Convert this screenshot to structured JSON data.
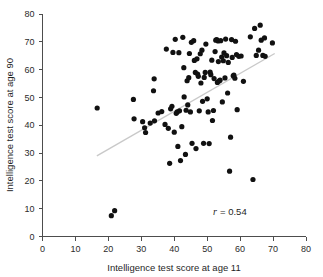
{
  "chart_data": {
    "type": "scatter",
    "title": "",
    "xlabel": "Intelligence test score at age 11",
    "ylabel": "Intelligence test score at age 90",
    "xlim": [
      0,
      80
    ],
    "ylim": [
      0,
      80
    ],
    "xticks": [
      0,
      10,
      20,
      30,
      40,
      50,
      60,
      70,
      80
    ],
    "yticks": [
      0,
      10,
      20,
      30,
      40,
      50,
      60,
      70,
      80
    ],
    "xticklabels": [
      "0",
      "10",
      "20",
      "30",
      "40",
      "50",
      "60",
      "70",
      "80"
    ],
    "yticklabels": [
      "0",
      "10",
      "20",
      "30",
      "40",
      "50",
      "60",
      "70",
      "80"
    ],
    "grid": false,
    "legend": null,
    "annotations": [
      {
        "name": "correlation-annotation",
        "symbol": "r",
        "text": "= 0.54",
        "full_text": "r = 0.54",
        "value": 0.54,
        "x": 52,
        "y": 9
      }
    ],
    "fit_line": {
      "name": "regression-line",
      "color": "#c9c9c9",
      "x_start": 16.5,
      "y_start": 29.0,
      "x_end": 70.5,
      "y_end": 65.8
    },
    "marker": {
      "shape": "circle",
      "color": "#111111",
      "size": 2.6
    },
    "points": [
      [
        16.6,
        46.2
      ],
      [
        20.9,
        7.5
      ],
      [
        21.9,
        9.3
      ],
      [
        27.6,
        49.3
      ],
      [
        27.8,
        42.3
      ],
      [
        30.4,
        41.3
      ],
      [
        31.0,
        39.1
      ],
      [
        31.3,
        37.4
      ],
      [
        32.7,
        40.8
      ],
      [
        33.7,
        52.4
      ],
      [
        33.9,
        56.7
      ],
      [
        34.0,
        41.6
      ],
      [
        35.1,
        44.4
      ],
      [
        36.2,
        44.9
      ],
      [
        37.2,
        40.3
      ],
      [
        37.6,
        67.4
      ],
      [
        38.2,
        38.9
      ],
      [
        38.6,
        26.3
      ],
      [
        38.9,
        45.9
      ],
      [
        39.3,
        46.8
      ],
      [
        39.6,
        66.2
      ],
      [
        40.0,
        37.5
      ],
      [
        40.3,
        70.9
      ],
      [
        40.6,
        44.3
      ],
      [
        40.9,
        44.8
      ],
      [
        41.1,
        32.4
      ],
      [
        41.4,
        66.1
      ],
      [
        41.6,
        45.2
      ],
      [
        41.9,
        27.3
      ],
      [
        42.3,
        39.5
      ],
      [
        42.6,
        71.6
      ],
      [
        42.9,
        60.7
      ],
      [
        43.0,
        50.2
      ],
      [
        43.4,
        29.5
      ],
      [
        43.6,
        45.4
      ],
      [
        43.9,
        56.0
      ],
      [
        44.1,
        47.3
      ],
      [
        44.4,
        57.1
      ],
      [
        44.6,
        65.8
      ],
      [
        44.9,
        44.8
      ],
      [
        45.2,
        69.8
      ],
      [
        45.4,
        33.5
      ],
      [
        45.9,
        70.4
      ],
      [
        46.1,
        63.3
      ],
      [
        46.4,
        59.0
      ],
      [
        46.6,
        31.6
      ],
      [
        46.9,
        63.9
      ],
      [
        47.1,
        58.4
      ],
      [
        47.3,
        57.6
      ],
      [
        47.6,
        45.2
      ],
      [
        47.9,
        65.7
      ],
      [
        48.1,
        55.2
      ],
      [
        48.4,
        67.0
      ],
      [
        48.6,
        48.6
      ],
      [
        48.9,
        33.5
      ],
      [
        49.1,
        57.2
      ],
      [
        49.4,
        59.0
      ],
      [
        49.6,
        69.2
      ],
      [
        50.0,
        49.5
      ],
      [
        50.3,
        44.8
      ],
      [
        50.6,
        33.4
      ],
      [
        50.9,
        59.1
      ],
      [
        51.1,
        58.2
      ],
      [
        51.4,
        63.4
      ],
      [
        51.6,
        41.7
      ],
      [
        51.9,
        45.3
      ],
      [
        52.1,
        56.8
      ],
      [
        52.4,
        66.5
      ],
      [
        52.6,
        70.6
      ],
      [
        52.9,
        70.8
      ],
      [
        53.1,
        55.4
      ],
      [
        53.3,
        70.3
      ],
      [
        53.4,
        62.9
      ],
      [
        53.6,
        55.9
      ],
      [
        53.9,
        56.2
      ],
      [
        54.1,
        70.4
      ],
      [
        54.4,
        64.5
      ],
      [
        54.6,
        48.4
      ],
      [
        54.9,
        63.2
      ],
      [
        55.1,
        66.0
      ],
      [
        55.4,
        57.0
      ],
      [
        55.6,
        71.0
      ],
      [
        55.9,
        65.0
      ],
      [
        56.2,
        51.6
      ],
      [
        56.4,
        62.6
      ],
      [
        56.8,
        23.5
      ],
      [
        57.1,
        35.7
      ],
      [
        57.4,
        70.8
      ],
      [
        57.6,
        64.4
      ],
      [
        57.9,
        57.8
      ],
      [
        58.1,
        58.0
      ],
      [
        58.4,
        56.9
      ],
      [
        58.6,
        70.2
      ],
      [
        58.9,
        65.4
      ],
      [
        59.1,
        45.6
      ],
      [
        59.6,
        64.8
      ],
      [
        60.3,
        64.9
      ],
      [
        61.0,
        55.8
      ],
      [
        63.1,
        71.8
      ],
      [
        63.9,
        20.5
      ],
      [
        64.4,
        74.8
      ],
      [
        64.9,
        65.1
      ],
      [
        65.6,
        67.0
      ],
      [
        66.1,
        76.0
      ],
      [
        66.4,
        70.6
      ],
      [
        66.9,
        65.1
      ],
      [
        67.4,
        71.4
      ],
      [
        67.6,
        64.8
      ],
      [
        69.8,
        69.6
      ]
    ]
  }
}
